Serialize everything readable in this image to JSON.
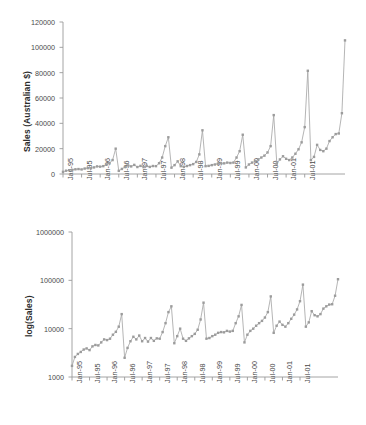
{
  "figure": {
    "background": "#ffffff",
    "series_color": "#a8a8a8",
    "marker_color": "#9c9c9c",
    "axis_color": "#9a9a9a",
    "text_color": "#4a4a4a"
  },
  "panels": {
    "top": {
      "ylabel": "Sales (Australian $)",
      "yticks": [
        "0",
        "20000",
        "40000",
        "60000",
        "80000",
        "100000",
        "120000"
      ],
      "xticks": [
        "Jan-95",
        "Jul-95",
        "Jan-96",
        "Jul-96",
        "Jan-97",
        "Jul-97",
        "Jan-98",
        "Jul-98",
        "Jan-99",
        "Jul-99",
        "Jan-00",
        "Jul-00",
        "Jan-01",
        "Jul-01"
      ]
    },
    "bottom": {
      "ylabel": "log(Sales)",
      "yticks": [
        "1000",
        "10000",
        "100000",
        "1000000"
      ],
      "xticks": [
        "Jan-95",
        "Jul-95",
        "Jan-96",
        "Jul-96",
        "Jan-97",
        "Jul-97",
        "Jan-98",
        "Jul-98",
        "Jan-99",
        "Jul-99",
        "Jan-00",
        "Jul-00",
        "Jan-01",
        "Jul-01"
      ]
    }
  },
  "chart_data": [
    {
      "type": "line",
      "title": "",
      "xlabel": "",
      "ylabel": "Sales (Australian $)",
      "ylim": [
        0,
        120000
      ],
      "yticks": [
        0,
        20000,
        40000,
        60000,
        80000,
        100000,
        120000
      ],
      "grid": false,
      "legend": "none",
      "scale": "linear",
      "x": [
        "Jan-95",
        "Feb-95",
        "Mar-95",
        "Apr-95",
        "May-95",
        "Jun-95",
        "Jul-95",
        "Aug-95",
        "Sep-95",
        "Oct-95",
        "Nov-95",
        "Dec-95",
        "Jan-96",
        "Feb-96",
        "Mar-96",
        "Apr-96",
        "May-96",
        "Jun-96",
        "Jul-96",
        "Aug-96",
        "Sep-96",
        "Oct-96",
        "Nov-96",
        "Dec-96",
        "Jan-97",
        "Feb-97",
        "Mar-97",
        "Apr-97",
        "May-97",
        "Jun-97",
        "Jul-97",
        "Aug-97",
        "Sep-97",
        "Oct-97",
        "Nov-97",
        "Dec-97",
        "Jan-98",
        "Feb-98",
        "Mar-98",
        "Apr-98",
        "May-98",
        "Jun-98",
        "Jul-98",
        "Aug-98",
        "Sep-98",
        "Oct-98",
        "Nov-98",
        "Dec-98",
        "Jan-99",
        "Feb-99",
        "Mar-99",
        "Apr-99",
        "May-99",
        "Jun-99",
        "Jul-99",
        "Aug-99",
        "Sep-99",
        "Oct-99",
        "Nov-99",
        "Dec-99",
        "Jan-00",
        "Feb-00",
        "Mar-00",
        "Apr-00",
        "May-00",
        "Jun-00",
        "Jul-00",
        "Aug-00",
        "Sep-00",
        "Oct-00",
        "Nov-00",
        "Dec-00",
        "Jan-01",
        "Feb-01",
        "Mar-01",
        "Apr-01",
        "May-01",
        "Jun-01",
        "Jul-01",
        "Aug-01",
        "Sep-01"
      ],
      "values": [
        1700,
        2600,
        3000,
        3300,
        3700,
        3900,
        3600,
        4300,
        4600,
        4500,
        5200,
        6000,
        5800,
        6200,
        7500,
        8600,
        11000,
        20000,
        2500,
        4000,
        5500,
        6800,
        6000,
        7200,
        5500,
        6400,
        5400,
        6400,
        5600,
        6300,
        6200,
        8500,
        13000,
        22000,
        29000,
        5000,
        7000,
        10000,
        6200,
        5600,
        6300,
        7000,
        7800,
        9500,
        15500,
        34500,
        6200,
        6400,
        7000,
        7500,
        8200,
        8500,
        8400,
        9000,
        8700,
        9000,
        13000,
        18000,
        31000,
        5200,
        7500,
        9000,
        10000,
        11500,
        13000,
        14500,
        17000,
        22000,
        46500,
        8200,
        11500,
        14000,
        12000,
        11000,
        13000,
        16000,
        19500,
        25000,
        37000,
        81500,
        11000
      ],
      "values_tail": [
        13500,
        23000,
        19000,
        18000,
        20000,
        26000,
        29000,
        31500,
        32000,
        48000,
        105500
      ]
    },
    {
      "type": "line",
      "title": "",
      "xlabel": "",
      "ylabel": "log(Sales)",
      "ylim": [
        1000,
        1000000
      ],
      "yticks": [
        1000,
        10000,
        100000,
        1000000
      ],
      "grid": false,
      "legend": "none",
      "scale": "log",
      "note": "Same sales series plotted on a base-10 logarithmic vertical axis",
      "x": [
        "Jan-95",
        "Feb-95",
        "Mar-95",
        "Apr-95",
        "May-95",
        "Jun-95",
        "Jul-95",
        "Aug-95",
        "Sep-95",
        "Oct-95",
        "Nov-95",
        "Dec-95",
        "Jan-96",
        "Feb-96",
        "Mar-96",
        "Apr-96",
        "May-96",
        "Jun-96",
        "Jul-96",
        "Aug-96",
        "Sep-96",
        "Oct-96",
        "Nov-96",
        "Dec-96",
        "Jan-97",
        "Feb-97",
        "Mar-97",
        "Apr-97",
        "May-97",
        "Jun-97",
        "Jul-97",
        "Aug-97",
        "Sep-97",
        "Oct-97",
        "Nov-97",
        "Dec-97",
        "Jan-98",
        "Feb-98",
        "Mar-98",
        "Apr-98",
        "May-98",
        "Jun-98",
        "Jul-98",
        "Aug-98",
        "Sep-98",
        "Oct-98",
        "Nov-98",
        "Dec-98",
        "Jan-99",
        "Feb-99",
        "Mar-99",
        "Apr-99",
        "May-99",
        "Jun-99",
        "Jul-99",
        "Aug-99",
        "Sep-99",
        "Oct-99",
        "Nov-99",
        "Dec-99",
        "Jan-00",
        "Feb-00",
        "Mar-00",
        "Apr-00",
        "May-00",
        "Jun-00",
        "Jul-00",
        "Aug-00",
        "Sep-00",
        "Oct-00",
        "Nov-00",
        "Dec-00",
        "Jan-01",
        "Feb-01",
        "Mar-01",
        "Apr-01",
        "May-01",
        "Jun-01",
        "Jul-01",
        "Aug-01",
        "Sep-01"
      ],
      "values": [
        1700,
        2600,
        3000,
        3300,
        3700,
        3900,
        3600,
        4300,
        4600,
        4500,
        5200,
        6000,
        5800,
        6200,
        7500,
        8600,
        11000,
        20000,
        2500,
        4000,
        5500,
        6800,
        6000,
        7200,
        5500,
        6400,
        5400,
        6400,
        5600,
        6300,
        6200,
        8500,
        13000,
        22000,
        29000,
        5000,
        7000,
        10000,
        6200,
        5600,
        6300,
        7000,
        7800,
        9500,
        15500,
        34500,
        6200,
        6400,
        7000,
        7500,
        8200,
        8500,
        8400,
        9000,
        8700,
        9000,
        13000,
        18000,
        31000,
        5200,
        7500,
        9000,
        10000,
        11500,
        13000,
        14500,
        17000,
        22000,
        46500,
        8200,
        11500,
        14000,
        12000,
        11000,
        13000,
        16000,
        19500,
        25000,
        37000,
        81500,
        11000
      ],
      "values_tail": [
        13500,
        23000,
        19000,
        18000,
        20000,
        26000,
        29000,
        31500,
        32000,
        48000,
        105500
      ]
    }
  ]
}
